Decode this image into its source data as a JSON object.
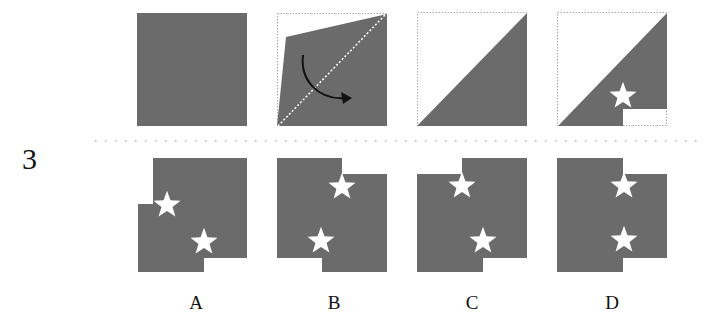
{
  "question": {
    "number": "3",
    "instruction_sequence": [
      {
        "step": 1,
        "description": "full square sheet",
        "shape": "square"
      },
      {
        "step": 2,
        "description": "fold along diagonal (bottom-left to top-right), curved arrow shows fold direction",
        "shape": "square-folding",
        "icon": "curved-arrow-icon"
      },
      {
        "step": 3,
        "description": "folded triangle",
        "shape": "triangle"
      },
      {
        "step": 4,
        "description": "triangle with star punched and bottom-right notch cut",
        "shape": "triangle-cut",
        "icon": "star-icon"
      }
    ]
  },
  "options": [
    {
      "label": "A"
    },
    {
      "label": "B"
    },
    {
      "label": "C"
    },
    {
      "label": "D"
    }
  ],
  "colors": {
    "fill": "#6b6b6b",
    "background": "#ffffff",
    "dotted_outline": "#b0b0b0",
    "arrow": "#111111",
    "text": "#111111"
  }
}
